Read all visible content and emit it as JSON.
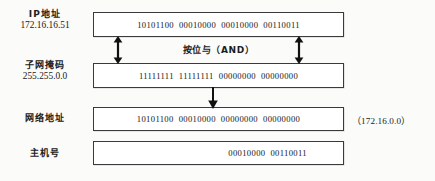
{
  "diagram": {
    "rows": [
      {
        "id": "ip-address",
        "label_cn": "IP地址",
        "label_value": "172.16.16.51",
        "bits": "10101100  00010000  00010000  00110011",
        "align": "center"
      },
      {
        "id": "subnet-mask",
        "label_cn": "子网掩码",
        "label_value": "255.255.0.0",
        "bits": "11111111  11111111  00000000  00000000",
        "align": "center"
      },
      {
        "id": "network-address",
        "label_cn": "网络地址",
        "label_value": "",
        "bits": "10101100  00010000  00000000  00000000",
        "align": "center",
        "annotation": "（172.16.0.0）"
      },
      {
        "id": "host-number",
        "label_cn": "主机号",
        "label_value": "",
        "bits": "00010000  00110011",
        "align": "right"
      }
    ],
    "operation_caption": "按位与（AND）",
    "arrows": [
      {
        "name": "and-arrow-left",
        "kind": "double-headed-vertical"
      },
      {
        "name": "and-arrow-right",
        "kind": "double-headed-vertical"
      },
      {
        "name": "result-arrow",
        "kind": "down"
      }
    ],
    "colors": {
      "box_border": "#3a3a3a",
      "box_fill": "#ffffff",
      "text": "#151515",
      "page_background": "#fbfbf9",
      "arrow": "#111111"
    }
  }
}
